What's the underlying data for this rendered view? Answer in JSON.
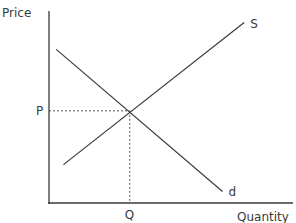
{
  "chart_data": {
    "type": "line",
    "title": "",
    "xlabel": "Quantity",
    "ylabel": "Price",
    "xlim": [
      0,
      10
    ],
    "ylim": [
      0,
      10
    ],
    "grid": false,
    "series": [
      {
        "name": "S",
        "label": "S",
        "points": [
          [
            0.6,
            2.0
          ],
          [
            8.1,
            9.4
          ]
        ]
      },
      {
        "name": "d",
        "label": "d",
        "points": [
          [
            0.3,
            8.0
          ],
          [
            7.2,
            0.6
          ]
        ]
      }
    ],
    "equilibrium": {
      "x": 3.35,
      "y": 4.8,
      "x_label": "Q",
      "y_label": "P"
    }
  }
}
